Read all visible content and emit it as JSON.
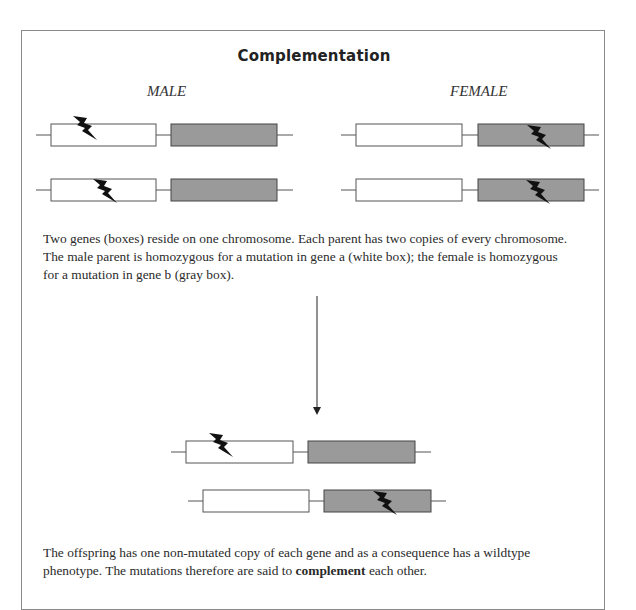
{
  "figure": {
    "title": "Complementation",
    "male_label": "MALE",
    "female_label": "FEMALE",
    "caption_parents": "Two genes (boxes) reside on one chromosome. Each parent has two copies of every chromosome. The male parent is homozygous for a mutation in gene a (white box); the female is homozygous for a mutation in gene b (gray box).",
    "caption_offspring_pre": "The offspring has one non-mutated copy of each gene and as a consequence has a wildtype phenotype. The mutations therefore are said to ",
    "caption_offspring_bold": "complement",
    "caption_offspring_post": " each other.",
    "colors": {
      "gene_a_fill": "#ffffff",
      "gene_b_fill": "#9a9a9a",
      "outline": "#555555",
      "mutation": "#111111"
    },
    "chromosomes": [
      {
        "parent": "male",
        "copy": 1,
        "mutated_gene": "a"
      },
      {
        "parent": "male",
        "copy": 2,
        "mutated_gene": "a"
      },
      {
        "parent": "female",
        "copy": 1,
        "mutated_gene": "b"
      },
      {
        "parent": "female",
        "copy": 2,
        "mutated_gene": "b"
      },
      {
        "parent": "offspring",
        "copy": 1,
        "mutated_gene": "a"
      },
      {
        "parent": "offspring",
        "copy": 2,
        "mutated_gene": "b"
      }
    ]
  }
}
